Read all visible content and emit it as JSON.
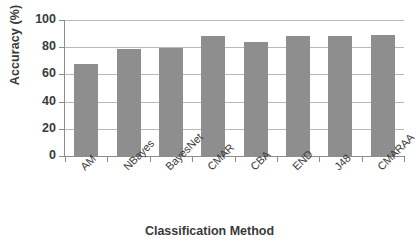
{
  "chart_data": {
    "type": "bar",
    "title": "",
    "xlabel": "Classification Method",
    "ylabel": "Accuracy (%)",
    "categories": [
      "AM",
      "NBayes",
      "BayesNet",
      "CMAR",
      "CBA",
      "END",
      "J48",
      "CMARAA"
    ],
    "values": [
      68,
      78.5,
      79.5,
      88,
      83.5,
      88,
      88.5,
      89
    ],
    "ylim": [
      0,
      100
    ],
    "yticks": [
      0,
      20,
      40,
      60,
      80,
      100
    ],
    "ytick_labels": [
      "0",
      "20",
      "40",
      "60",
      "80",
      "100"
    ],
    "grid": "horizontal",
    "legend": "none",
    "bar_color": "#8e8e8e",
    "axis_color": "#8d8d8d",
    "gridline_color": "#b9b9b9",
    "text_color": "#3a3a3a"
  }
}
